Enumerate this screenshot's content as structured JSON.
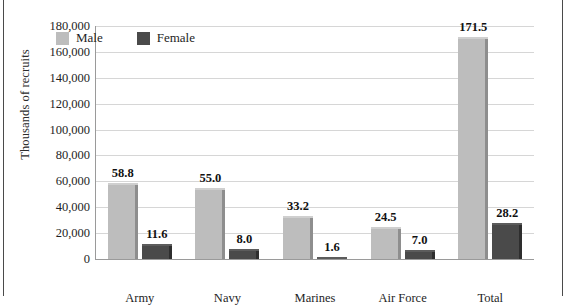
{
  "figure": {
    "caption_partial": "",
    "y_axis_title": "Thousands of recruits"
  },
  "legend": {
    "items": [
      {
        "label": "Male",
        "color": "#bdbdbd"
      },
      {
        "label": "Female",
        "color": "#4a4a4a"
      }
    ]
  },
  "chart_data": {
    "type": "bar",
    "title": "",
    "xlabel": "",
    "ylabel": "Thousands of recruits",
    "ylim": [
      0,
      180000
    ],
    "ytick_labels": [
      "180,000",
      "160,000",
      "140,000",
      "120,000",
      "100,000",
      "80,000",
      "60,000",
      "40,000",
      "20,000",
      "0"
    ],
    "ytick_values": [
      180000,
      160000,
      140000,
      120000,
      100000,
      80000,
      60000,
      40000,
      20000,
      0
    ],
    "grid": true,
    "legend_position": "inside-top-left",
    "categories": [
      "Army",
      "Navy",
      "Marines",
      "Air Force",
      "Total"
    ],
    "series": [
      {
        "name": "Male",
        "color": "#bdbdbd",
        "values": [
          58800,
          55000,
          33200,
          24500,
          171500
        ],
        "labels": [
          "58.8",
          "55.0",
          "33.2",
          "24.5",
          "171.5"
        ]
      },
      {
        "name": "Female",
        "color": "#4a4a4a",
        "values": [
          11600,
          8000,
          1600,
          7000,
          28200
        ],
        "labels": [
          "11.6",
          "8.0",
          "1.6",
          "7.0",
          "28.2"
        ]
      }
    ]
  }
}
